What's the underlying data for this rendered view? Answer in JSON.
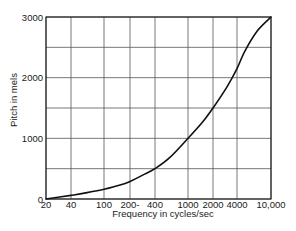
{
  "chart_data": {
    "type": "line",
    "title": "",
    "xlabel": "Frequency in cycles/sec",
    "ylabel": "Pitch in mels",
    "x_scale": "log",
    "xlim": [
      20,
      10000
    ],
    "ylim": [
      0,
      3000
    ],
    "grid": true,
    "legend": null,
    "x_ticks": [
      20,
      40,
      100,
      200,
      400,
      1000,
      2000,
      4000,
      10000
    ],
    "x_tick_labels": [
      "20",
      "40",
      "100",
      "200-",
      "400",
      "1000",
      "2000",
      "4000",
      "10,000"
    ],
    "y_ticks": [
      0,
      1000,
      2000,
      3000
    ],
    "y_tick_labels": [
      "0",
      "1000",
      "2000",
      "3000"
    ],
    "y_gridlines": [
      0,
      500,
      1000,
      1500,
      2000,
      2500,
      3000
    ],
    "series": [
      {
        "name": "Pitch vs Frequency",
        "x": [
          20,
          40,
          60,
          100,
          150,
          200,
          300,
          400,
          600,
          1000,
          1500,
          2000,
          3000,
          4000,
          5000,
          7000,
          10000
        ],
        "y": [
          0,
          60,
          100,
          160,
          225,
          290,
          410,
          500,
          680,
          1000,
          1270,
          1500,
          1850,
          2150,
          2450,
          2780,
          3000
        ]
      }
    ]
  },
  "labels": {
    "xlabel": "Frequency in cycles/sec",
    "ylabel": "Pitch in mels"
  }
}
